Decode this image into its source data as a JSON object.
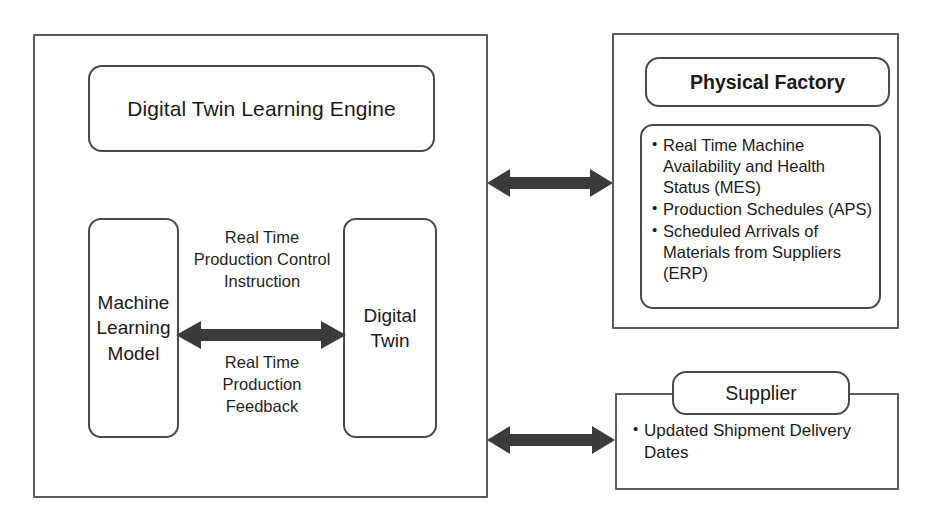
{
  "diagram": {
    "stroke_color": "#4a4a4a",
    "arrow_color": "#3b3b3b",
    "background": "#ffffff"
  },
  "left_system": {
    "engine_label": "Digital Twin Learning Engine",
    "machine_learning_model_label": "Machine\nLearning\nModel",
    "digital_twin_label": "Digital\nTwin",
    "flow_top_label": "Real Time\nProduction Control\nInstruction",
    "flow_bottom_label": "Real Time\nProduction\nFeedback"
  },
  "physical_factory": {
    "title": "Physical Factory",
    "items": [
      "Real Time Machine Availability and Health Status (MES)",
      "Production Schedules (APS)",
      "Scheduled Arrivals of Materials from Suppliers (ERP)"
    ]
  },
  "supplier": {
    "title": "Supplier",
    "items": [
      "Updated Shipment Delivery Dates"
    ]
  },
  "connectors": {
    "engine_to_factory": "bidirectional-arrow",
    "engine_to_supplier": "bidirectional-arrow",
    "ml_to_digital_twin": "bidirectional-arrow"
  }
}
